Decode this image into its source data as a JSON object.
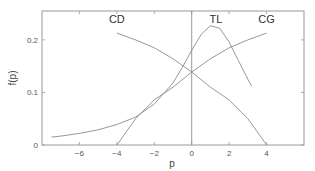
{
  "chart_data": {
    "type": "line",
    "title": "",
    "xlabel": "p",
    "ylabel": "f(p)",
    "xlim": [
      -8,
      6
    ],
    "ylim": [
      0,
      0.255
    ],
    "xticks": [
      -6,
      -4,
      -2,
      0,
      2,
      4
    ],
    "xtick_labels": [
      "−6",
      "−4",
      "−2",
      "0",
      "2",
      "4"
    ],
    "yticks": [
      0,
      0.1,
      0.2
    ],
    "ytick_labels": [
      "0",
      "0.1",
      "0.2"
    ],
    "grid": false,
    "vline_at_x": 0,
    "legend_position": "inline labels",
    "series": [
      {
        "name": "CD",
        "label_pos": [
          -4.0,
          0.232
        ],
        "x": [
          -4,
          -3,
          -2,
          -1,
          0,
          1,
          2,
          3,
          4
        ],
        "y": [
          0.213,
          0.2,
          0.185,
          0.164,
          0.139,
          0.11,
          0.086,
          0.05,
          0.0
        ]
      },
      {
        "name": "TL",
        "label_pos": [
          1.3,
          0.232
        ],
        "x": [
          -7.5,
          -7,
          -6,
          -5,
          -4,
          -3,
          -2,
          -1,
          -0.5,
          0,
          0.5,
          1,
          1.5,
          2,
          2.5,
          3,
          3.2
        ],
        "y": [
          0.015,
          0.017,
          0.022,
          0.029,
          0.039,
          0.053,
          0.078,
          0.118,
          0.148,
          0.18,
          0.21,
          0.227,
          0.222,
          0.196,
          0.16,
          0.125,
          0.112
        ]
      },
      {
        "name": "CG",
        "label_pos": [
          4.0,
          0.232
        ],
        "x": [
          -4,
          -3,
          -2,
          -1,
          0,
          1,
          2,
          3,
          4
        ],
        "y": [
          0.0,
          0.05,
          0.086,
          0.11,
          0.139,
          0.164,
          0.185,
          0.2,
          0.213
        ]
      }
    ]
  }
}
